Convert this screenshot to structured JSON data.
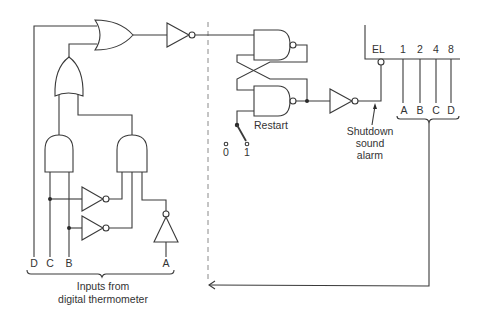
{
  "diagram": {
    "type": "logic-circuit",
    "input_labels": {
      "D": "D",
      "C": "C",
      "B": "B",
      "A": "A"
    },
    "inputs_caption_line1": "Inputs from",
    "inputs_caption_line2": "digital thermometer",
    "latch_label": "Restart",
    "switch_label_0": "0",
    "switch_label_1": "1",
    "alarm_label_line1": "Shutdown",
    "alarm_label_line2": "sound",
    "alarm_label_line3": "alarm",
    "display": {
      "enable_label": "EL",
      "weights": [
        "1",
        "2",
        "4",
        "8"
      ],
      "bcd_inputs": [
        "A",
        "B",
        "C",
        "D"
      ]
    },
    "components": [
      "OR gate (top)",
      "inverter (top)",
      "OR gate (lower)",
      "AND gate (left)",
      "AND gate (right)",
      "inverter (C)",
      "inverter (B)",
      "inverter (A)",
      "NAND latch (2 cross-coupled NAND gates)",
      "restart switch",
      "output inverter",
      "display with EL and BCD inputs"
    ]
  }
}
